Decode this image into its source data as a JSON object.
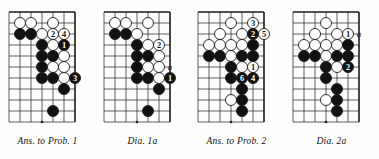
{
  "page": {
    "background_color": "#fdfdfb",
    "line_color": "#1a1a1a",
    "black_stone_color": "#111111",
    "white_stone_color": "#ffffff"
  },
  "diagrams": [
    {
      "id": "ans-to-prob-1",
      "caption": "Ans. to Prob. 1",
      "caption_name": "Ans. to Prob.",
      "caption_number": "1",
      "grid": {
        "cols": 7,
        "rows": 11,
        "spacing": 11,
        "origin_x": 9,
        "origin_y": 12
      },
      "edges": {
        "top": true,
        "right": true
      },
      "star_points": [
        {
          "col": 3,
          "row": 10
        }
      ],
      "stones": [
        {
          "color": "white",
          "col": 1,
          "row": 1
        },
        {
          "color": "white",
          "col": 2,
          "row": 1
        },
        {
          "color": "white",
          "col": 4,
          "row": 1
        },
        {
          "color": "black",
          "col": 1,
          "row": 2
        },
        {
          "color": "black",
          "col": 2,
          "row": 2
        },
        {
          "color": "white",
          "col": 3,
          "row": 2
        },
        {
          "color": "white",
          "col": 4,
          "row": 2,
          "label": "2",
          "label_color": "black"
        },
        {
          "color": "white",
          "col": 5,
          "row": 2,
          "label": "4",
          "label_color": "black"
        },
        {
          "color": "black",
          "col": 3,
          "row": 3
        },
        {
          "color": "white",
          "col": 4,
          "row": 3
        },
        {
          "color": "black",
          "col": 5,
          "row": 3,
          "label": "1",
          "label_color": "white"
        },
        {
          "color": "black",
          "col": 3,
          "row": 4
        },
        {
          "color": "black",
          "col": 4,
          "row": 4
        },
        {
          "color": "white",
          "col": 5,
          "row": 4
        },
        {
          "color": "black",
          "col": 3,
          "row": 5
        },
        {
          "color": "white",
          "col": 4,
          "row": 5
        },
        {
          "color": "white",
          "col": 5,
          "row": 5
        },
        {
          "color": "black",
          "col": 3,
          "row": 6
        },
        {
          "color": "black",
          "col": 4,
          "row": 6
        },
        {
          "color": "white",
          "col": 5,
          "row": 6
        },
        {
          "color": "black",
          "col": 6,
          "row": 6,
          "label": "3",
          "label_color": "white"
        },
        {
          "color": "black",
          "col": 5,
          "row": 7
        },
        {
          "color": "black",
          "col": 4,
          "row": 9
        }
      ],
      "markers": []
    },
    {
      "id": "dia-1a",
      "caption": "Dia.   1a",
      "caption_name": "Dia.",
      "caption_number": "1a",
      "grid": {
        "cols": 7,
        "rows": 11,
        "spacing": 11,
        "origin_x": 9,
        "origin_y": 12
      },
      "edges": {
        "top": true,
        "right": true
      },
      "star_points": [
        {
          "col": 3,
          "row": 10
        }
      ],
      "stones": [
        {
          "color": "white",
          "col": 1,
          "row": 1
        },
        {
          "color": "white",
          "col": 2,
          "row": 1
        },
        {
          "color": "white",
          "col": 4,
          "row": 1
        },
        {
          "color": "black",
          "col": 1,
          "row": 2
        },
        {
          "color": "black",
          "col": 2,
          "row": 2
        },
        {
          "color": "white",
          "col": 3,
          "row": 2
        },
        {
          "color": "black",
          "col": 3,
          "row": 3
        },
        {
          "color": "white",
          "col": 4,
          "row": 3
        },
        {
          "color": "white",
          "col": 5,
          "row": 3,
          "label": "2",
          "label_color": "black"
        },
        {
          "color": "black",
          "col": 3,
          "row": 4
        },
        {
          "color": "black",
          "col": 4,
          "row": 4
        },
        {
          "color": "white",
          "col": 5,
          "row": 4
        },
        {
          "color": "black",
          "col": 3,
          "row": 5
        },
        {
          "color": "white",
          "col": 4,
          "row": 5
        },
        {
          "color": "white",
          "col": 5,
          "row": 5
        },
        {
          "color": "black",
          "col": 3,
          "row": 6
        },
        {
          "color": "black",
          "col": 4,
          "row": 6
        },
        {
          "color": "white",
          "col": 5,
          "row": 6
        },
        {
          "color": "black",
          "col": 6,
          "row": 6,
          "label": "1",
          "label_color": "white"
        },
        {
          "color": "black",
          "col": 5,
          "row": 7
        },
        {
          "color": "black",
          "col": 4,
          "row": 9
        }
      ],
      "markers": [
        {
          "text": "a",
          "col": 6,
          "row": 5
        }
      ]
    },
    {
      "id": "ans-to-prob-2",
      "caption": "Ans. to Prob. 2",
      "caption_name": "Ans. to Prob.",
      "caption_number": "2",
      "grid": {
        "cols": 7,
        "rows": 11,
        "spacing": 11,
        "origin_x": 9,
        "origin_y": 12
      },
      "edges": {
        "top": true,
        "right": true
      },
      "star_points": [
        {
          "col": 3,
          "row": 10
        }
      ],
      "stones": [
        {
          "color": "white",
          "col": 3,
          "row": 1
        },
        {
          "color": "white",
          "col": 5,
          "row": 1,
          "label": "3",
          "label_color": "black"
        },
        {
          "color": "white",
          "col": 2,
          "row": 2
        },
        {
          "color": "white",
          "col": 4,
          "row": 2
        },
        {
          "color": "black",
          "col": 5,
          "row": 2,
          "label": "2",
          "label_color": "white"
        },
        {
          "color": "white",
          "col": 6,
          "row": 2,
          "label": "5",
          "label_color": "black"
        },
        {
          "color": "white",
          "col": 1,
          "row": 3
        },
        {
          "color": "white",
          "col": 2,
          "row": 3
        },
        {
          "color": "white",
          "col": 3,
          "row": 3
        },
        {
          "color": "white",
          "col": 4,
          "row": 3
        },
        {
          "color": "black",
          "col": 5,
          "row": 3
        },
        {
          "color": "black",
          "col": 1,
          "row": 4
        },
        {
          "color": "black",
          "col": 2,
          "row": 4
        },
        {
          "color": "white",
          "col": 3,
          "row": 4
        },
        {
          "color": "black",
          "col": 4,
          "row": 4
        },
        {
          "color": "black",
          "col": 5,
          "row": 4
        },
        {
          "color": "black",
          "col": 3,
          "row": 5
        },
        {
          "color": "white",
          "col": 4,
          "row": 5
        },
        {
          "color": "white",
          "col": 5,
          "row": 5,
          "label": "1",
          "label_color": "black"
        },
        {
          "color": "black",
          "col": 3,
          "row": 6
        },
        {
          "color": "black",
          "col": 4,
          "row": 6,
          "label": "6",
          "label_color": "white"
        },
        {
          "color": "black",
          "col": 5,
          "row": 6,
          "label": "4",
          "label_color": "white"
        },
        {
          "color": "black",
          "col": 4,
          "row": 7
        },
        {
          "color": "white",
          "col": 3,
          "row": 8
        },
        {
          "color": "black",
          "col": 4,
          "row": 8
        },
        {
          "color": "black",
          "col": 4,
          "row": 9
        }
      ],
      "markers": []
    },
    {
      "id": "dia-2a",
      "caption": "Dia.   2a",
      "caption_name": "Dia.",
      "caption_number": "2a",
      "grid": {
        "cols": 7,
        "rows": 11,
        "spacing": 11,
        "origin_x": 9,
        "origin_y": 12
      },
      "edges": {
        "top": true,
        "right": true
      },
      "star_points": [
        {
          "col": 3,
          "row": 10
        }
      ],
      "stones": [
        {
          "color": "white",
          "col": 3,
          "row": 1
        },
        {
          "color": "white",
          "col": 2,
          "row": 2
        },
        {
          "color": "white",
          "col": 4,
          "row": 2
        },
        {
          "color": "white",
          "col": 5,
          "row": 2,
          "label": "1",
          "label_color": "black"
        },
        {
          "color": "white",
          "col": 1,
          "row": 3
        },
        {
          "color": "white",
          "col": 2,
          "row": 3
        },
        {
          "color": "white",
          "col": 3,
          "row": 3
        },
        {
          "color": "white",
          "col": 4,
          "row": 3
        },
        {
          "color": "black",
          "col": 5,
          "row": 3
        },
        {
          "color": "black",
          "col": 1,
          "row": 4
        },
        {
          "color": "black",
          "col": 2,
          "row": 4
        },
        {
          "color": "white",
          "col": 3,
          "row": 4
        },
        {
          "color": "black",
          "col": 4,
          "row": 4
        },
        {
          "color": "black",
          "col": 5,
          "row": 4
        },
        {
          "color": "black",
          "col": 3,
          "row": 5
        },
        {
          "color": "white",
          "col": 4,
          "row": 5
        },
        {
          "color": "black",
          "col": 5,
          "row": 5,
          "label": "2",
          "label_color": "white"
        },
        {
          "color": "black",
          "col": 3,
          "row": 6
        },
        {
          "color": "black",
          "col": 4,
          "row": 7
        },
        {
          "color": "white",
          "col": 3,
          "row": 8
        },
        {
          "color": "black",
          "col": 4,
          "row": 8
        },
        {
          "color": "black",
          "col": 4,
          "row": 9
        }
      ],
      "markers": [
        {
          "text": "a",
          "col": 6,
          "row": 2
        }
      ]
    }
  ]
}
